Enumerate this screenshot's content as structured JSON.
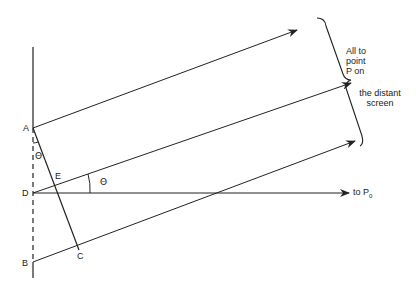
{
  "diagram": {
    "points": {
      "A": "A",
      "B": "B",
      "C": "C",
      "D": "D",
      "E": "E"
    },
    "angle_label_1": "Θ",
    "angle_label_2": "Θ",
    "horizontal_ray_label": "to P",
    "horizontal_ray_subscript": "0",
    "brace_note_line1": "All to",
    "brace_note_line2": "point",
    "brace_note_line3": "P on",
    "brace_note_line4": "the distant",
    "brace_note_line5": "screen",
    "colors": {
      "stroke": "#222222",
      "background": "#ffffff"
    }
  }
}
